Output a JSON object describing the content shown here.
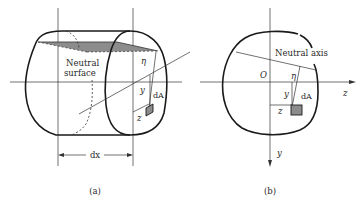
{
  "figure_a": {
    "caption": "(a)",
    "neutral_surface_line1": "Neutral",
    "neutral_surface_line2": "surface",
    "eta": "η",
    "y": "y",
    "z": "z",
    "dA": "dA",
    "dx": "dx"
  },
  "figure_b": {
    "caption": "(b)",
    "neutral_axis": "Neutral axis",
    "origin": "O",
    "eta": "η",
    "y_inner": "y",
    "z_inner": "z",
    "dA": "dA",
    "z_axis": "z",
    "y_axis": "y"
  },
  "colors": {
    "stroke": "#1a1a1a",
    "thin": "#333333",
    "shade": "#8c8c8c"
  }
}
